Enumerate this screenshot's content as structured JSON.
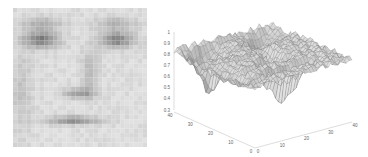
{
  "face_image": {
    "description": "Low-resolution grayscale face image",
    "grid_size": 30
  },
  "chart_data": {
    "type": "surface",
    "title": "",
    "xlabel": "",
    "ylabel": "",
    "zlabel": "",
    "x_ticks": [
      "0",
      "10",
      "20",
      "30",
      "40"
    ],
    "y_ticks": [
      "0",
      "10",
      "20",
      "30",
      "40"
    ],
    "z_ticks": [
      "0.3",
      "0.4",
      "0.5",
      "0.6",
      "0.7",
      "0.8",
      "0.9",
      "1"
    ],
    "xlim": [
      0,
      40
    ],
    "ylim": [
      0,
      40
    ],
    "zlim": [
      0.3,
      1
    ],
    "grid": false,
    "colormap": "gray"
  }
}
